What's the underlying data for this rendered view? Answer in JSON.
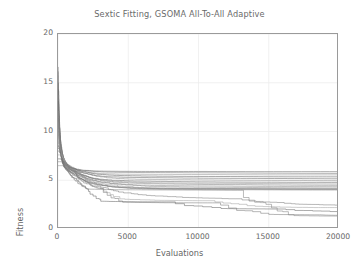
{
  "chart_data": {
    "type": "line",
    "title": "Sextic Fitting, GSOMA All-To-All Adaptive",
    "xlabel": "Evaluations",
    "ylabel": "Fitness",
    "xlim": [
      0,
      20000
    ],
    "ylim": [
      0,
      20
    ],
    "xticks": [
      0,
      5000,
      10000,
      15000,
      20000
    ],
    "xtick_labels": [
      "0",
      "5000",
      "10000",
      "15000",
      "20000"
    ],
    "yticks": [
      0,
      5,
      10,
      15,
      20
    ],
    "ytick_labels": [
      "0",
      "5",
      "10",
      "15",
      "20"
    ],
    "grid": true,
    "legend": "none",
    "line_color": "#808080",
    "frame_color": "#9a9a9a",
    "grid_color": "#ededed",
    "background": "#ffffff",
    "series": [
      {
        "name": "run-1",
        "x": [
          0,
          60,
          120,
          200,
          320,
          520,
          900,
          1500,
          2400,
          4000,
          6500,
          10000,
          14000,
          20000
        ],
        "y": [
          16.5,
          13.2,
          10.4,
          8.6,
          7.4,
          6.8,
          6.3,
          6.05,
          5.95,
          5.92,
          5.9,
          5.9,
          5.88,
          5.88
        ]
      },
      {
        "name": "run-2",
        "x": [
          0,
          70,
          150,
          260,
          420,
          700,
          1200,
          2000,
          3200,
          5200,
          8000,
          12000,
          16000,
          20000
        ],
        "y": [
          16.2,
          12.6,
          9.8,
          8.3,
          7.2,
          6.6,
          6.2,
          6.0,
          5.85,
          5.8,
          5.78,
          5.75,
          5.72,
          5.7
        ]
      },
      {
        "name": "run-3",
        "x": [
          0,
          55,
          130,
          230,
          380,
          640,
          1100,
          1900,
          3000,
          4800,
          7500,
          11500,
          15500,
          20000
        ],
        "y": [
          15.8,
          12.0,
          9.4,
          8.1,
          7.1,
          6.5,
          6.15,
          5.9,
          5.7,
          5.62,
          5.6,
          5.58,
          5.55,
          5.55
        ]
      },
      {
        "name": "run-4",
        "x": [
          0,
          80,
          170,
          290,
          460,
          760,
          1300,
          2100,
          3400,
          5500,
          8600,
          12800,
          16800,
          20000
        ],
        "y": [
          15.1,
          11.5,
          9.1,
          7.9,
          7.0,
          6.45,
          6.1,
          5.8,
          5.55,
          5.45,
          5.4,
          5.38,
          5.35,
          5.35
        ]
      },
      {
        "name": "run-5",
        "x": [
          0,
          65,
          140,
          250,
          400,
          680,
          1150,
          1950,
          3100,
          5000,
          7800,
          11800,
          15800,
          20000
        ],
        "y": [
          14.4,
          11.0,
          8.9,
          7.8,
          6.95,
          6.4,
          6.05,
          5.7,
          5.4,
          5.3,
          5.25,
          5.2,
          5.18,
          5.15
        ]
      },
      {
        "name": "run-6",
        "x": [
          0,
          90,
          190,
          320,
          500,
          820,
          1400,
          2250,
          3600,
          5800,
          9000,
          13200,
          17200,
          20000
        ],
        "y": [
          13.6,
          10.6,
          8.7,
          7.7,
          6.9,
          6.35,
          6.0,
          5.6,
          5.25,
          5.1,
          5.05,
          5.0,
          4.98,
          4.95
        ]
      },
      {
        "name": "run-7",
        "x": [
          0,
          60,
          135,
          240,
          390,
          660,
          1120,
          1880,
          2950,
          4700,
          7300,
          11200,
          15200,
          20000
        ],
        "y": [
          12.9,
          10.2,
          8.5,
          7.6,
          6.85,
          6.3,
          5.95,
          5.5,
          5.1,
          4.95,
          4.88,
          4.82,
          4.8,
          4.78
        ]
      },
      {
        "name": "run-8",
        "x": [
          0,
          75,
          160,
          280,
          440,
          740,
          1250,
          2050,
          3300,
          5300,
          8200,
          12400,
          16400,
          20000
        ],
        "y": [
          12.2,
          9.9,
          8.4,
          7.5,
          6.8,
          6.25,
          5.9,
          5.4,
          5.0,
          4.8,
          4.72,
          4.68,
          4.65,
          4.62
        ]
      },
      {
        "name": "run-9",
        "x": [
          0,
          85,
          180,
          310,
          480,
          800,
          1350,
          2200,
          3500,
          5600,
          8800,
          13000,
          17000,
          20000
        ],
        "y": [
          11.5,
          9.6,
          8.3,
          7.45,
          6.75,
          6.2,
          5.85,
          5.3,
          4.9,
          4.68,
          4.6,
          4.55,
          4.5,
          4.48
        ]
      },
      {
        "name": "run-10",
        "x": [
          0,
          62,
          145,
          255,
          410,
          690,
          1180,
          1980,
          3150,
          5050,
          7900,
          11900,
          15900,
          20000
        ],
        "y": [
          10.8,
          9.3,
          8.2,
          7.4,
          6.7,
          6.18,
          5.8,
          5.2,
          4.8,
          4.55,
          4.45,
          4.4,
          4.36,
          4.34
        ]
      },
      {
        "name": "run-11",
        "x": [
          0,
          95,
          200,
          340,
          530,
          860,
          1450,
          2300,
          3700,
          5900,
          9200,
          13400,
          17400,
          20000
        ],
        "y": [
          10.1,
          9.0,
          8.1,
          7.35,
          6.65,
          6.15,
          5.75,
          5.1,
          4.7,
          4.42,
          4.3,
          4.26,
          4.22,
          4.2
        ]
      },
      {
        "name": "run-12",
        "x": [
          0,
          58,
          125,
          225,
          370,
          620,
          1080,
          1850,
          2900,
          4600,
          7200,
          11000,
          15000,
          20000
        ],
        "y": [
          9.5,
          8.8,
          8.05,
          7.3,
          6.6,
          6.12,
          5.7,
          5.0,
          4.6,
          4.3,
          4.2,
          4.16,
          4.14,
          4.12
        ]
      },
      {
        "name": "run-13",
        "x": [
          0,
          100,
          210,
          360,
          560,
          900,
          1500,
          2400,
          3850,
          6100,
          9500,
          13700,
          17600,
          20000
        ],
        "y": [
          9.0,
          8.6,
          8.0,
          7.28,
          6.58,
          6.1,
          5.65,
          4.9,
          4.5,
          4.22,
          4.15,
          4.12,
          4.1,
          4.1
        ]
      },
      {
        "name": "run-14",
        "x": [
          0,
          68,
          155,
          270,
          430,
          720,
          1220,
          2000,
          3250,
          5150,
          8100,
          12200,
          16200,
          20000
        ],
        "y": [
          8.6,
          8.4,
          7.95,
          7.25,
          6.55,
          6.08,
          5.6,
          4.85,
          4.45,
          4.2,
          4.12,
          4.1,
          4.08,
          4.08
        ]
      },
      {
        "name": "run-15",
        "x": [
          0,
          110,
          230,
          390,
          600,
          960,
          1600,
          2600,
          4100,
          6400,
          9900,
          14000,
          17800,
          20000
        ],
        "y": [
          8.3,
          8.2,
          7.9,
          7.22,
          6.5,
          6.05,
          5.5,
          4.7,
          4.3,
          4.1,
          4.05,
          4.02,
          4.0,
          4.0
        ]
      },
      {
        "name": "run-16",
        "x": [
          0,
          72,
          165,
          285,
          450,
          760,
          1280,
          2100,
          3400,
          5400,
          8400,
          12600,
          16600,
          20000
        ],
        "y": [
          8.0,
          8.0,
          7.8,
          7.2,
          6.48,
          6.02,
          5.4,
          4.6,
          4.2,
          3.6,
          3.3,
          3.1,
          2.6,
          2.45
        ]
      },
      {
        "name": "run-17",
        "x": [
          0,
          120,
          260,
          430,
          660,
          1050,
          1750,
          2800,
          4400,
          6900,
          10600,
          14600,
          18200,
          20000
        ],
        "y": [
          7.6,
          7.7,
          7.6,
          7.15,
          6.45,
          6.0,
          5.3,
          4.4,
          3.1,
          2.95,
          2.9,
          2.3,
          2.2,
          2.2
        ]
      },
      {
        "name": "run-18",
        "x": [
          0,
          66,
          150,
          265,
          420,
          700,
          1200,
          1950,
          3150,
          5000,
          7700,
          11600,
          15600,
          20000
        ],
        "y": [
          7.2,
          7.3,
          7.3,
          7.1,
          6.42,
          5.95,
          5.2,
          4.3,
          2.85,
          2.8,
          2.78,
          2.1,
          2.05,
          1.75
        ]
      },
      {
        "name": "run-19",
        "x": [
          0,
          130,
          280,
          460,
          700,
          1120,
          1850,
          2950,
          4600,
          7200,
          11000,
          15000,
          18600,
          20000
        ],
        "y": [
          6.9,
          7.0,
          7.0,
          6.9,
          6.4,
          5.9,
          5.0,
          4.15,
          2.75,
          2.7,
          2.68,
          1.5,
          1.45,
          1.4
        ]
      },
      {
        "name": "run-20",
        "x": [
          0,
          78,
          175,
          300,
          470,
          780,
          1320,
          2150,
          3450,
          5500,
          8600,
          12800,
          16800,
          20000
        ],
        "y": [
          6.5,
          6.6,
          6.6,
          6.6,
          6.35,
          5.85,
          4.9,
          4.1,
          4.05,
          4.02,
          4.0,
          3.98,
          1.38,
          1.32
        ]
      }
    ]
  }
}
